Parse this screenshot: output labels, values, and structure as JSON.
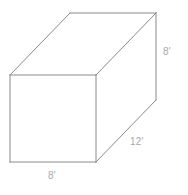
{
  "figure": {
    "kind": "rectangular-prism",
    "background_color": "#ffffff",
    "line_color": "#8a8a8a",
    "label_color": "#a9a9a9",
    "line_width": 1,
    "labels": {
      "height": "8'",
      "depth": "12'",
      "width": "8'"
    },
    "dimensions": {
      "height_value": "8",
      "depth_value": "12",
      "width_value": "8",
      "unit": "'"
    },
    "geometry": {
      "front_face": {
        "top_left": [
          10,
          75
        ],
        "top_right": [
          96,
          75
        ],
        "bottom_right": [
          96,
          162
        ],
        "bottom_left": [
          10,
          162
        ]
      },
      "back_face": {
        "top_left": [
          70,
          13
        ],
        "top_right": [
          156,
          13
        ],
        "bottom_right": [
          156,
          100
        ],
        "bottom_left": [
          70,
          100
        ]
      },
      "visible_edges": [
        "front-top",
        "front-right",
        "front-bottom",
        "front-left",
        "back-top",
        "back-right",
        "connector-top-left",
        "connector-top-right",
        "connector-bottom-right"
      ],
      "hidden_edges": [
        "back-left",
        "back-bottom",
        "connector-bottom-left"
      ]
    }
  }
}
